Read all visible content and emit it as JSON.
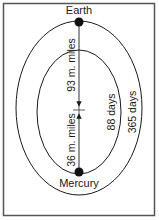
{
  "diagram": {
    "planets": {
      "earth": {
        "label": "Earth"
      },
      "mercury": {
        "label": "Mercury"
      }
    },
    "distances": {
      "earth_to_sun": "93 m. miles",
      "mercury_to_sun": "36 m. miles"
    },
    "orbital_periods": {
      "mercury": "88 days",
      "earth": "365 days"
    },
    "colors": {
      "line": "#1a1a1a",
      "frame": "#555555",
      "background": "#ffffff"
    }
  }
}
